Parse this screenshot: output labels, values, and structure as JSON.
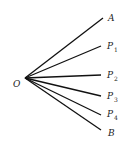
{
  "diagram": {
    "vertex": {
      "label": "O"
    },
    "rays": [
      {
        "id": "A",
        "label": "A",
        "subscript": ""
      },
      {
        "id": "P1",
        "label": "P",
        "subscript": "1"
      },
      {
        "id": "P2",
        "label": "P",
        "subscript": "2"
      },
      {
        "id": "P3",
        "label": "P",
        "subscript": "3"
      },
      {
        "id": "P4",
        "label": "P",
        "subscript": "4"
      },
      {
        "id": "B",
        "label": "B",
        "subscript": ""
      }
    ]
  }
}
